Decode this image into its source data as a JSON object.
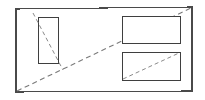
{
  "figure": {
    "type": "line-drawing",
    "width": 205,
    "height": 100,
    "background_color": "#ffffff",
    "stroke_color": "#3a3a3a",
    "dashed_stroke_color": "#7a7a7a"
  },
  "frame": {
    "name": "outer-quadrilateral",
    "points": "16,9 192,7 192,91 16,92",
    "corners": {
      "top_left": [
        16,
        9
      ],
      "top_right": [
        192,
        7
      ],
      "bottom_right": [
        192,
        91
      ],
      "bottom_left": [
        16,
        92
      ]
    }
  },
  "rectangles": [
    {
      "name": "left-portrait-rectangle",
      "orientation": "portrait",
      "x": 38,
      "y": 17,
      "width": 20,
      "height": 46,
      "diagonal": {
        "x1": 38,
        "y1": 17,
        "x2": 58,
        "y2": 63
      }
    },
    {
      "name": "upper-right-landscape-rectangle",
      "orientation": "landscape",
      "x": 122,
      "y": 16,
      "width": 58,
      "height": 27,
      "diagonal": {
        "x1": 122,
        "y1": 43,
        "x2": 180,
        "y2": 16
      }
    },
    {
      "name": "lower-right-landscape-rectangle",
      "orientation": "landscape",
      "x": 122,
      "y": 52,
      "width": 58,
      "height": 28,
      "diagonal": {
        "x1": 122,
        "y1": 80,
        "x2": 180,
        "y2": 52
      }
    }
  ],
  "dashed_lines": [
    {
      "name": "main-diagonal",
      "description": "Long dashed diagonal from bottom-left corner of frame to top-right corner of frame",
      "x1": 17,
      "y1": 91,
      "x2": 191,
      "y2": 8
    },
    {
      "name": "left-rectangle-diagonal",
      "description": "Dashed diagonal through the left portrait rectangle extending slightly beyond both ends",
      "x1": 33,
      "y1": 13,
      "x2": 63,
      "y2": 70
    },
    {
      "name": "upper-right-rectangle-diagonal",
      "description": "Dashed diagonal across the upper right landscape rectangle, coincident with the main diagonal",
      "x1": 122,
      "y1": 43,
      "x2": 180,
      "y2": 16
    },
    {
      "name": "lower-right-rectangle-diagonal",
      "description": "Dashed diagonal across the lower right landscape rectangle",
      "x1": 123,
      "y1": 79,
      "x2": 179,
      "y2": 53
    }
  ]
}
